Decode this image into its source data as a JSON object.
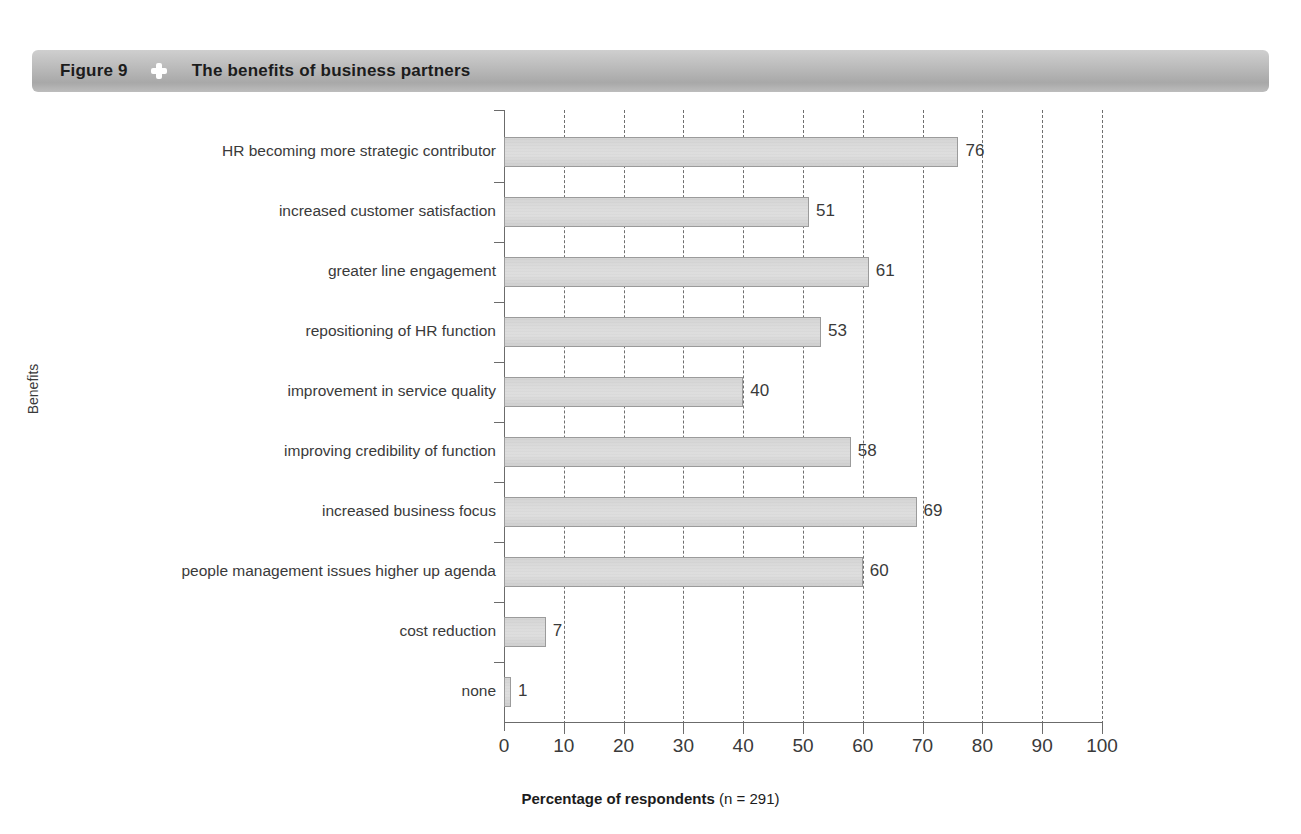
{
  "header": {
    "figure_label": "Figure 9",
    "separator_icon": "four-petal-diamond-icon",
    "title": "The benefits of business partners"
  },
  "chart_data": {
    "type": "bar",
    "orientation": "horizontal",
    "title": "The benefits of business partners",
    "xlabel_bold": "Percentage of respondents",
    "xlabel_light": "(n = 291)",
    "ylabel": "Benefits",
    "xlim": [
      0,
      100
    ],
    "xticks": [
      0,
      10,
      20,
      30,
      40,
      50,
      60,
      70,
      80,
      90,
      100
    ],
    "xtick_labels": [
      "0",
      "10",
      "20",
      "30",
      "40",
      "50",
      "60",
      "70",
      "80",
      "90",
      "100"
    ],
    "grid": "vertical-dashed",
    "legend": "none",
    "bar_fill": "#dcdcdc",
    "bar_border": "#9b9b9b",
    "categories": [
      "HR becoming more strategic contributor",
      "increased customer satisfaction",
      "greater line engagement",
      "repositioning of HR function",
      "improvement in service quality",
      "improving credibility of function",
      "increased business focus",
      "people management issues higher up agenda",
      "cost reduction",
      "none"
    ],
    "values": [
      76,
      51,
      61,
      53,
      40,
      58,
      69,
      60,
      7,
      1
    ],
    "value_labels": [
      "76",
      "51",
      "61",
      "53",
      "40",
      "58",
      "69",
      "60",
      "7",
      "1"
    ]
  }
}
